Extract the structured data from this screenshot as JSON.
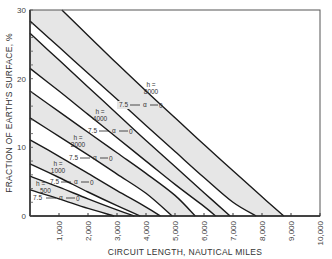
{
  "chart_data": {
    "type": "line",
    "title": "",
    "xlabel": "CIRCUIT LENGTH, NAUTICAL MILES",
    "ylabel": "FRACTION OF EARTH'S SURFACE, %",
    "xlim": [
      0,
      10000
    ],
    "ylim": [
      0,
      30
    ],
    "x_ticks": [
      1000,
      2000,
      3000,
      4000,
      5000,
      6000,
      7000,
      8000,
      9000,
      10000
    ],
    "x_tick_labels": [
      "1,000",
      "2,000",
      "3,000",
      "4,000",
      "5,000",
      "6,000",
      "7,000",
      "8,000",
      "9,000",
      "10,000"
    ],
    "y_ticks": [
      0,
      10,
      20,
      30
    ],
    "y_tick_labels": [
      "0",
      "10",
      "20",
      "30"
    ],
    "grid": false,
    "legend": null,
    "series": [
      {
        "name": "h=8000, α=0",
        "x": [
          1100,
          2000,
          3000,
          4000,
          5000,
          6000,
          7000,
          8000,
          8750
        ],
        "y": [
          30,
          26.3,
          22.2,
          18.2,
          14.3,
          10.4,
          6.6,
          2.8,
          0
        ]
      },
      {
        "name": "h=8000, α=7.5",
        "x": [
          0,
          1000,
          2000,
          3000,
          4000,
          5000,
          6000,
          7000,
          7800
        ],
        "y": [
          28.4,
          24.6,
          20.8,
          17.0,
          13.2,
          9.4,
          5.6,
          2.0,
          0
        ]
      },
      {
        "name": "h=4000, α=0",
        "x": [
          0,
          1000,
          2000,
          3000,
          4000,
          5000,
          6000,
          6900
        ],
        "y": [
          26.6,
          22.7,
          18.8,
          14.9,
          11.0,
          7.2,
          3.4,
          0
        ]
      },
      {
        "name": "h=4000, α=7.5",
        "x": [
          0,
          1000,
          2000,
          3000,
          4000,
          5000,
          6000,
          6400
        ],
        "y": [
          21.5,
          18.2,
          14.8,
          11.4,
          8.0,
          4.6,
          1.4,
          0
        ]
      },
      {
        "name": "h=2000, α=0",
        "x": [
          0,
          1000,
          2000,
          3000,
          4000,
          5000,
          5700
        ],
        "y": [
          18.2,
          15.2,
          12.2,
          9.2,
          6.2,
          3.0,
          0
        ]
      },
      {
        "name": "h=2000, α=7.5",
        "x": [
          0,
          1000,
          2000,
          3000,
          4000,
          4900
        ],
        "y": [
          14.3,
          11.6,
          8.9,
          6.1,
          3.3,
          0
        ]
      },
      {
        "name": "h=1000, α=0",
        "x": [
          0,
          1000,
          2000,
          3000,
          4000,
          4500
        ],
        "y": [
          11.1,
          8.7,
          6.2,
          3.7,
          1.3,
          0
        ]
      },
      {
        "name": "h=1000, α=7.5",
        "x": [
          0,
          1000,
          2000,
          3000,
          3800
        ],
        "y": [
          7.6,
          5.6,
          3.5,
          1.5,
          0
        ]
      },
      {
        "name": "h=500, α=0",
        "x": [
          0,
          1000,
          2000,
          3000,
          3600
        ],
        "y": [
          5.8,
          4.2,
          2.5,
          0.9,
          0
        ]
      },
      {
        "name": "h=500, α=7.5",
        "x": [
          0,
          1000,
          2000,
          2900
        ],
        "y": [
          3.8,
          2.5,
          1.1,
          0
        ]
      }
    ],
    "shaded_bands": [
      "h=8000",
      "h=4000",
      "h=2000",
      "h=1000",
      "h=500"
    ],
    "annotations": [
      {
        "label": "h=8000",
        "alpha_from": "7.5",
        "alpha_symbol": "α",
        "alpha_to": "0"
      },
      {
        "label": "h=4000",
        "alpha_from": "7.5",
        "alpha_symbol": "α",
        "alpha_to": "0"
      },
      {
        "label": "h=2000",
        "alpha_from": "7.5",
        "alpha_symbol": "α",
        "alpha_to": "0"
      },
      {
        "label": "h=1000",
        "alpha_from": "7.5",
        "alpha_symbol": "α",
        "alpha_to": "0"
      },
      {
        "label": "h=500",
        "alpha_from": "7.5",
        "alpha_symbol": "α",
        "alpha_to": "0"
      }
    ]
  },
  "labels": {
    "h_prefix": "h =",
    "h8000": "8000",
    "h4000": "4000",
    "h2000": "2000",
    "h1000": "1000",
    "h500": "500",
    "alpha_from": "7.5",
    "alpha": "α",
    "alpha_to": "0"
  },
  "colors": {
    "band_fill": "#e6e6e6",
    "line": "#1a1a1a",
    "axis": "#333333"
  }
}
